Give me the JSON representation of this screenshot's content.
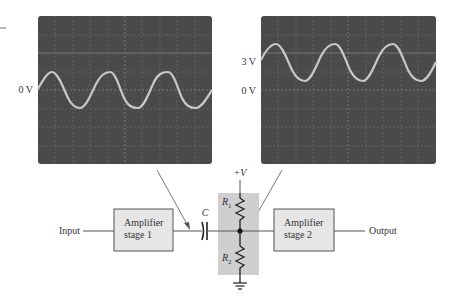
{
  "scopes": {
    "left": {
      "zero_label": "0 V"
    },
    "right": {
      "offset_label": "3 V",
      "zero_label": "0 V"
    }
  },
  "circuit": {
    "input_label": "Input",
    "output_label": "Output",
    "stage1_line1": "Amplifier",
    "stage1_line2": "stage 1",
    "stage2_line1": "Amplifier",
    "stage2_line2": "stage 2",
    "capacitor_label": "C",
    "supply_label": "+V",
    "r1_label": "R",
    "r1_sub": "1",
    "r2_label": "R",
    "r2_sub": "2"
  },
  "colors": {
    "screen": "#4a4a4a",
    "trace": "#c8c8c8",
    "grid": "#7a7a7a",
    "block_fill": "#e6e6e6",
    "bias_fill": "#cfcfcf",
    "line": "#555555"
  }
}
